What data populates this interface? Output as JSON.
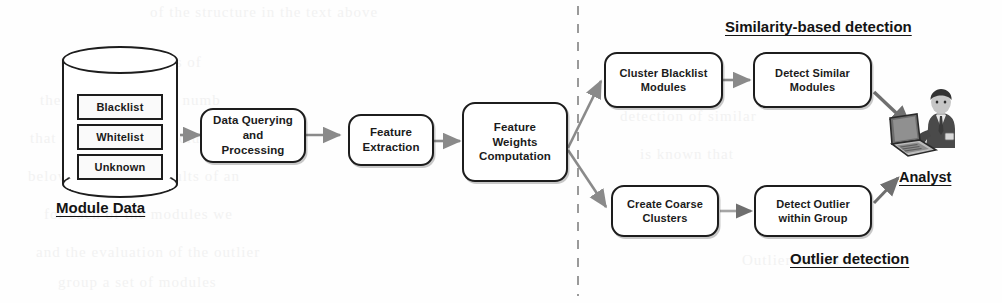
{
  "diagram": {
    "divider": {
      "name": "vertical-dashed-divider",
      "x": 578,
      "style": "dashed"
    },
    "colors": {
      "box_stroke": "#1d1d1d",
      "box_fill": "#ffffff",
      "arrow": "#8a8a8a",
      "arrow_dark": "#6f6f6f",
      "text": "#1b1b1b",
      "caption": "#141414",
      "divider": "#9a9a9a",
      "ghost_text": "#f2f2f2"
    }
  },
  "source": {
    "name": "module-data-store",
    "caption": "Module Data",
    "slots": [
      {
        "label": "Blacklist"
      },
      {
        "label": "Whitelist"
      },
      {
        "label": "Unknown"
      }
    ]
  },
  "pipeline": [
    {
      "id": "data-querying",
      "lines": [
        "Data Querying",
        "and Processing"
      ]
    },
    {
      "id": "feature-extraction",
      "lines": [
        "Feature",
        "Extraction"
      ]
    },
    {
      "id": "feature-weights",
      "lines": [
        "Feature",
        "Weights",
        "Computation"
      ]
    }
  ],
  "branches": {
    "similarity": {
      "caption": "Similarity-based detection",
      "steps": [
        {
          "id": "cluster-blacklist-modules",
          "lines": [
            "Cluster Blacklist",
            "Modules"
          ]
        },
        {
          "id": "detect-similar-modules",
          "lines": [
            "Detect Similar",
            "Modules"
          ]
        }
      ]
    },
    "outlier": {
      "caption": "Outlier detection",
      "steps": [
        {
          "id": "create-coarse-clusters",
          "lines": [
            "Create Coarse",
            "Clusters"
          ]
        },
        {
          "id": "detect-outlier-within-group",
          "lines": [
            "Detect Outlier",
            "within Group"
          ]
        }
      ]
    }
  },
  "consumer": {
    "name": "analyst",
    "label": "Analyst",
    "icon": "analyst-with-laptop-icon"
  },
  "background_ghost_text": [
    {
      "text": "of the structure in the text above",
      "x": 150,
      "y": 4
    },
    {
      "text": "te  in  a  w  th  stems  of",
      "x": 60,
      "y": 54
    },
    {
      "text": "the  p  tion  of  a  large  numb",
      "x": 40,
      "y": 92
    },
    {
      "text": "that  are  based  on  the  cluster",
      "x": 30,
      "y": 130
    },
    {
      "text": "below  we  present  results  of  an",
      "x": 28,
      "y": 168
    },
    {
      "text": "for  each  of  the  modules  we",
      "x": 44,
      "y": 206
    },
    {
      "text": "and  the  evaluation  of  the  outlier",
      "x": 36,
      "y": 244
    },
    {
      "text": "group  a  set  of  modules",
      "x": 58,
      "y": 274
    },
    {
      "text": "detection  of  similar",
      "x": 620,
      "y": 108
    },
    {
      "text": "is  known  that",
      "x": 640,
      "y": 146
    },
    {
      "text": "Outlier  scores",
      "x": 742,
      "y": 252
    }
  ]
}
